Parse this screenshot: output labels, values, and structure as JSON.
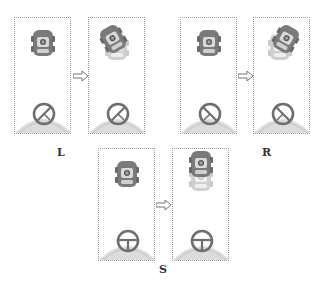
{
  "figure": {
    "groups": [
      {
        "label": "L",
        "steering": "left",
        "before_rotation": 0,
        "after_rotation": -35,
        "wheel_rotation": 35
      },
      {
        "label": "R",
        "steering": "right",
        "before_rotation": 0,
        "after_rotation": 35,
        "wheel_rotation": -35
      },
      {
        "label": "S",
        "steering": "straight",
        "before_rotation": 0,
        "after_rotation": 0,
        "wheel_rotation": 0
      }
    ],
    "arrow_symbol": "⇨",
    "colors": {
      "car_body": "#7a7a7a",
      "car_window": "#d9d9d9",
      "wheel": "#6e6e6e",
      "dashboard": "#d6d6d6",
      "frame_border": "#9a9a9a"
    }
  }
}
